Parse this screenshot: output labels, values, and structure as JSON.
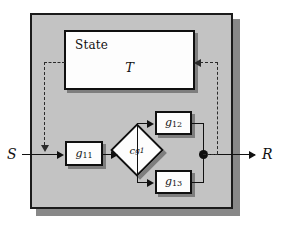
{
  "diagram": {
    "type": "block-diagram",
    "panel": {
      "name": "system-boundary",
      "fill_color": "#c3c3c3",
      "border_color": "#1b1b1b",
      "shadow_color": "#888888"
    },
    "state_box": {
      "label": "State",
      "variable": "T",
      "fill_color": "#fdfdfd",
      "border_color": "#101010"
    },
    "nodes": [
      {
        "id": "g11",
        "base": "g",
        "sub": "11",
        "shape": "rect"
      },
      {
        "id": "g12",
        "base": "g",
        "sub": "12",
        "shape": "rect"
      },
      {
        "id": "g13",
        "base": "g",
        "sub": "13",
        "shape": "rect"
      },
      {
        "id": "cg1",
        "base": "c",
        "sub": "g1",
        "shape": "diamond"
      }
    ],
    "io": {
      "input_label": "S",
      "output_label": "R"
    },
    "junction": {
      "name": "merge-dot",
      "color": "#0d0d0d"
    },
    "edges": [
      {
        "from": "S",
        "to": "g11",
        "style": "solid"
      },
      {
        "from": "g11",
        "to": "cg1",
        "style": "solid"
      },
      {
        "from": "cg1",
        "to": "g12",
        "style": "solid"
      },
      {
        "from": "cg1",
        "to": "g13",
        "style": "solid"
      },
      {
        "from": "g12",
        "to": "junction",
        "style": "solid"
      },
      {
        "from": "g13",
        "to": "junction",
        "style": "solid"
      },
      {
        "from": "junction",
        "to": "R",
        "style": "solid"
      },
      {
        "from": "state_box",
        "to": "input-line",
        "style": "dashed"
      },
      {
        "from": "junction",
        "to": "state_box",
        "style": "dashed"
      }
    ],
    "wire_color": "#111111",
    "dashed_wire_color": "#2a2a2a"
  }
}
